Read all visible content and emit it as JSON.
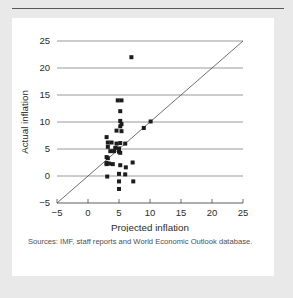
{
  "figure": {
    "source_note": "Sources:  IMF, staff reports and World Economic Outlook database.",
    "panel_background": "#ffffff",
    "page_background": "#e9e9e9",
    "marker_color": "#1c1c1c",
    "grid_color": "#6e6e70"
  },
  "chart_data": {
    "type": "scatter",
    "title": "",
    "xlabel": "Projected inflation",
    "ylabel": "Actual inflation",
    "xlim": [
      -5,
      25
    ],
    "ylim": [
      -5,
      25
    ],
    "xticks": [
      -5,
      0,
      5,
      10,
      15,
      20,
      25
    ],
    "yticks": [
      -5,
      0,
      5,
      10,
      15,
      20,
      25
    ],
    "xticklabels": [
      "−5",
      "0",
      "5",
      "10",
      "15",
      "20",
      "25"
    ],
    "yticklabels": [
      "−5",
      "0",
      "5",
      "10",
      "15",
      "20",
      "25"
    ],
    "grid": "horizontal",
    "legend": "none",
    "reference_line": {
      "name": "45-degree line",
      "from": [
        -5,
        -5
      ],
      "to": [
        25,
        25
      ]
    },
    "series": [
      {
        "name": "Countries",
        "marker": "square",
        "points": [
          [
            7.0,
            22.0
          ],
          [
            4.8,
            14.0
          ],
          [
            5.4,
            14.0
          ],
          [
            5.2,
            12.0
          ],
          [
            5.2,
            10.2
          ],
          [
            5.4,
            9.6
          ],
          [
            5.2,
            9.2
          ],
          [
            4.6,
            8.4
          ],
          [
            5.4,
            8.3
          ],
          [
            3.0,
            7.2
          ],
          [
            3.2,
            6.2
          ],
          [
            3.8,
            6.2
          ],
          [
            4.6,
            6.0
          ],
          [
            5.2,
            6.1
          ],
          [
            6.0,
            6.0
          ],
          [
            3.2,
            5.4
          ],
          [
            4.4,
            5.2
          ],
          [
            5.0,
            5.1
          ],
          [
            3.6,
            4.6
          ],
          [
            4.2,
            4.6
          ],
          [
            5.0,
            4.5
          ],
          [
            5.2,
            4.3
          ],
          [
            3.0,
            3.5
          ],
          [
            3.2,
            3.3
          ],
          [
            3.0,
            2.4
          ],
          [
            3.0,
            2.2
          ],
          [
            3.4,
            2.3
          ],
          [
            4.0,
            2.2
          ],
          [
            5.2,
            2.0
          ],
          [
            6.1,
            1.6
          ],
          [
            7.2,
            2.5
          ],
          [
            5.0,
            0.4
          ],
          [
            6.0,
            0.3
          ],
          [
            3.1,
            -0.1
          ],
          [
            5.0,
            -1.0
          ],
          [
            7.3,
            -1.0
          ],
          [
            5.0,
            -2.4
          ],
          [
            9.0,
            8.9
          ],
          [
            10.1,
            10.1
          ]
        ]
      }
    ]
  }
}
